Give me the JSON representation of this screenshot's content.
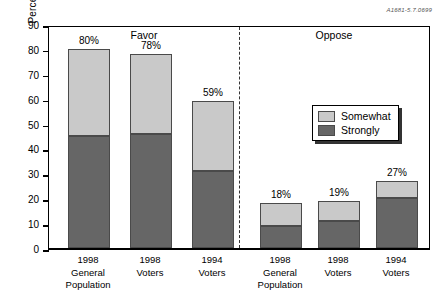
{
  "doc_code": "A1681-5.7.0699",
  "colors": {
    "somewhat": "#c9c9c9",
    "strongly": "#666666",
    "outline": "#4a4a4a",
    "axis": "#000000"
  },
  "legend": {
    "items": [
      {
        "label": "Somewhat",
        "color": "#c9c9c9"
      },
      {
        "label": "Strongly",
        "color": "#666666"
      }
    ]
  },
  "sections": [
    {
      "label": "Favor"
    },
    {
      "label": "Oppose"
    }
  ],
  "chart_data": {
    "type": "bar",
    "subtype": "stacked-bar",
    "title": "",
    "xlabel": "",
    "ylabel": "Percentage",
    "ylim": [
      0,
      90
    ],
    "yticks": [
      0,
      10,
      20,
      30,
      40,
      50,
      60,
      70,
      80,
      90
    ],
    "grid": false,
    "legend_position": "inside-upper-right",
    "groups": [
      "Favor",
      "Oppose"
    ],
    "categories": [
      "1998 General Population",
      "1998 Voters",
      "1994 Voters",
      "1998 General Population",
      "1998 Voters",
      "1994 Voters"
    ],
    "category_lines": [
      [
        "1998",
        "General",
        "Population"
      ],
      [
        "1998",
        "Voters"
      ],
      [
        "1994",
        "Voters"
      ],
      [
        "1998",
        "General",
        "Population"
      ],
      [
        "1998",
        "Voters"
      ],
      [
        "1994",
        "Voters"
      ]
    ],
    "series": [
      {
        "name": "Strongly",
        "values": [
          45,
          46,
          31,
          9,
          11,
          20
        ]
      },
      {
        "name": "Somewhat",
        "values": [
          35,
          32,
          28,
          9,
          8,
          7
        ]
      }
    ],
    "totals": [
      80,
      78,
      59,
      18,
      19,
      27
    ],
    "data_labels": [
      "80%",
      "78%",
      "59%",
      "18%",
      "19%",
      "27%"
    ]
  }
}
